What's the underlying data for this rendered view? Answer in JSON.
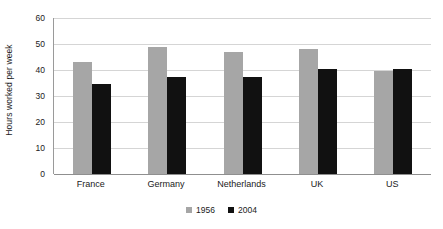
{
  "chart_data": {
    "type": "bar",
    "title": "",
    "subtitle": "",
    "xlabel": "",
    "ylabel": "Hours worked per week",
    "categories": [
      "France",
      "Germany",
      "Netherlands",
      "UK",
      "US"
    ],
    "series": [
      {
        "name": "1956",
        "color": "#a6a6a6",
        "values": [
          43,
          49,
          47,
          48,
          39.5
        ]
      },
      {
        "name": "2004",
        "color": "#111111",
        "values": [
          34.5,
          37.5,
          37.5,
          40.5,
          40.5
        ]
      }
    ],
    "ylim": [
      0,
      60
    ],
    "y_ticks": [
      0,
      10,
      20,
      30,
      40,
      50,
      60
    ],
    "y_tick_labels": [
      "0",
      "10",
      "20",
      "30",
      "40",
      "50",
      "60"
    ],
    "grid": true,
    "grid_axis": "y",
    "legend": {
      "position": "bottom",
      "entries": [
        {
          "label": "1956",
          "color": "#a6a6a6"
        },
        {
          "label": "2004",
          "color": "#111111"
        }
      ]
    },
    "plot_background": "#ffffff",
    "gridline_color": "#d5d5d5",
    "axis_color": "#8f8f8f"
  }
}
